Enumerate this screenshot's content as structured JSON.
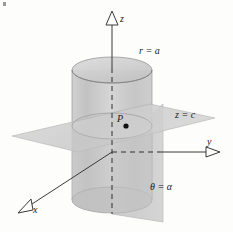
{
  "figure": {
    "background_color": "#fdfdfc"
  },
  "axes": [
    {
      "id": "z",
      "label": "z",
      "arrow": "open-triangle-up",
      "x1": 112,
      "y1": 168,
      "x2": 112,
      "y2": 25,
      "style": "solid-above-dashed-inside"
    },
    {
      "id": "y",
      "label": "y",
      "arrow": "open-triangle-right",
      "x1": 112,
      "y1": 152,
      "x2": 213,
      "y2": 152,
      "style": "dashed-inside-solid-outside"
    },
    {
      "id": "x",
      "label": "x",
      "arrow": "open-triangle-downleft",
      "x1": 112,
      "y1": 152,
      "x2": 26,
      "y2": 208,
      "style": "solid"
    }
  ],
  "surfaces": [
    {
      "id": "cylinder",
      "label": "r = a",
      "label_x": 139,
      "label_y": 54,
      "color_body": "#c5c5c5",
      "color_top": "#d8d8d8",
      "radius_px": 40,
      "top_y": 70,
      "bottom_y": 200
    },
    {
      "id": "plane-z",
      "label": "z = c",
      "label_x": 175,
      "label_y": 118,
      "color": "#d2d2d2"
    },
    {
      "id": "halfplane-theta",
      "label": "θ = α",
      "label_x": 150,
      "label_y": 190,
      "color": "#cacaca"
    }
  ],
  "point": {
    "label": "P",
    "label_x": 117,
    "label_y": 122,
    "dot_x": 126,
    "dot_y": 126,
    "dot_color": "#111111",
    "dot_radius": 2.6
  },
  "line_colors": {
    "axis": "#3a3a3a",
    "dashed": "#2e2e2e",
    "outline": "#8e8e8e"
  }
}
